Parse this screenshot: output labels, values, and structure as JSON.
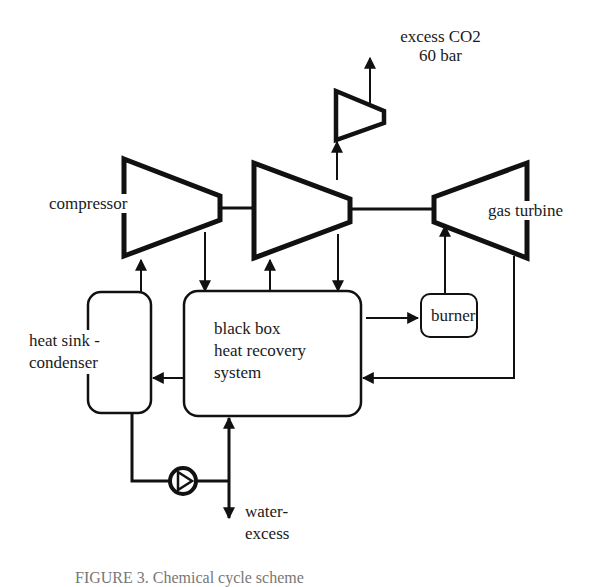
{
  "diagram": {
    "type": "process flow diagram",
    "nodes": [
      {
        "id": "compressor",
        "label": "compressor",
        "shape": "compressor-trapezoid"
      },
      {
        "id": "co2-compressor-main",
        "label": "",
        "shape": "compressor-trapezoid"
      },
      {
        "id": "co2-compressor-small",
        "label": "",
        "shape": "compressor-trapezoid"
      },
      {
        "id": "gas-turbine",
        "label": "gas turbine",
        "shape": "turbine-trapezoid"
      },
      {
        "id": "heat-sink",
        "label_line1": "heat sink -",
        "label_line2": "condenser",
        "shape": "rounded-rect"
      },
      {
        "id": "heat-recovery",
        "label_line1": "black box",
        "label_line2": "heat recovery",
        "label_line3": "system",
        "shape": "rounded-rect"
      },
      {
        "id": "burner",
        "label": "burner",
        "shape": "rounded-rect"
      },
      {
        "id": "pump",
        "label": "",
        "shape": "pump-circle"
      }
    ],
    "outputs": {
      "co2_line1": "excess CO2",
      "co2_line2": "60 bar",
      "water_line1": "water-",
      "water_line2": "excess"
    },
    "edges": [
      {
        "from": "compressor",
        "to": "heat-recovery"
      },
      {
        "from": "heat-recovery",
        "to": "co2-compressor-main"
      },
      {
        "from": "co2-compressor-main",
        "to": "heat-recovery"
      },
      {
        "from": "co2-compressor-main",
        "to": "co2-compressor-small"
      },
      {
        "from": "co2-compressor-small",
        "to": "excess CO2 60 bar"
      },
      {
        "from": "heat-recovery",
        "to": "burner"
      },
      {
        "from": "burner",
        "to": "gas-turbine"
      },
      {
        "from": "gas-turbine",
        "to": "heat-recovery"
      },
      {
        "from": "heat-recovery",
        "to": "heat-sink"
      },
      {
        "from": "heat-sink",
        "to": "compressor"
      },
      {
        "from": "heat-sink",
        "to": "pump"
      },
      {
        "from": "pump",
        "to": "heat-recovery"
      },
      {
        "from": "pump",
        "to": "water-excess"
      }
    ],
    "shaft": "compressor - co2-compressor-main - gas-turbine (common shaft)"
  },
  "caption": {
    "text": "FIGURE 3.  Chemical  cycle  scheme"
  }
}
